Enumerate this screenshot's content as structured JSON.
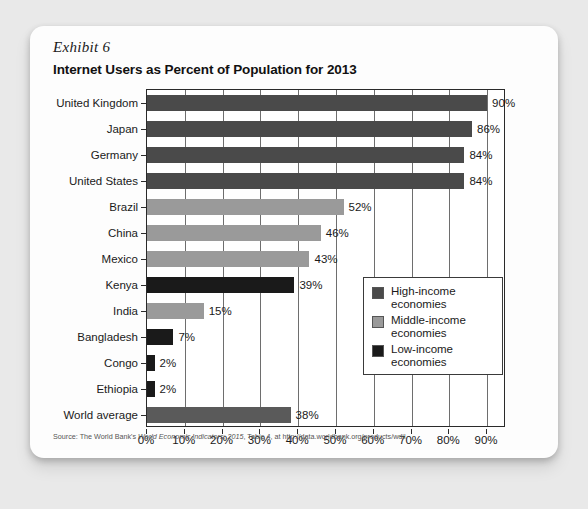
{
  "exhibit": {
    "label": "Exhibit 6",
    "title": "Internet Users as Percent of Population for 2013"
  },
  "source": {
    "prefix": "Source: The World Bank's ",
    "italic": "World Economic Indicators: 2015",
    "suffix": ", Table 4, at http://data.worldbank.org/products/wdil"
  },
  "legend": {
    "items": [
      {
        "label_line1": "High-income",
        "label_line2": "economies",
        "color": "#4a4a4a"
      },
      {
        "label_line1": "Middle-income",
        "label_line2": "economies",
        "color": "#9a9a9a"
      },
      {
        "label_line1": "Low-income",
        "label_line2": "economies",
        "color": "#1a1a1a"
      }
    ]
  },
  "chart_data": {
    "type": "bar",
    "orientation": "horizontal",
    "title": "Internet Users as Percent of Population for 2013",
    "xlabel": "",
    "ylabel": "",
    "xlim": [
      0,
      95
    ],
    "grid": true,
    "legend_position": "inside-right",
    "tick_labels": [
      "0%",
      "10%",
      "20%",
      "30%",
      "40%",
      "50%",
      "60%",
      "70%",
      "80%",
      "90%"
    ],
    "tick_values": [
      0,
      10,
      20,
      30,
      40,
      50,
      60,
      70,
      80,
      90
    ],
    "categories": [
      "United Kingdom",
      "Japan",
      "Germany",
      "United States",
      "Brazil",
      "China",
      "Mexico",
      "Kenya",
      "India",
      "Bangladesh",
      "Congo",
      "Ethiopia",
      "World average"
    ],
    "values": [
      90,
      86,
      84,
      84,
      52,
      46,
      43,
      39,
      15,
      7,
      2,
      2,
      38
    ],
    "value_labels": [
      "90%",
      "86%",
      "84%",
      "84%",
      "52%",
      "46%",
      "43%",
      "39%",
      "15%",
      "7%",
      "2%",
      "2%",
      "38%"
    ],
    "groups": [
      "high",
      "high",
      "high",
      "high",
      "middle",
      "middle",
      "middle",
      "low",
      "middle",
      "low",
      "low",
      "low",
      "world"
    ],
    "colors": {
      "high": "#4a4a4a",
      "middle": "#9a9a9a",
      "low": "#1a1a1a",
      "world": "#5a5a5a"
    }
  }
}
